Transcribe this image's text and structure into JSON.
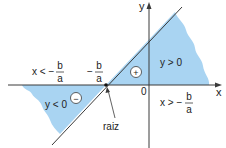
{
  "diagram": {
    "colors": {
      "shade": "#a9d4f2",
      "line": "#3a3a3a",
      "axis": "#3a3a3a",
      "text": "#222222"
    },
    "axes": {
      "x_label": "x",
      "y_label": "y",
      "origin_label": "0"
    },
    "regions": {
      "positive": {
        "label": "y > 0",
        "sign": "+"
      },
      "negative": {
        "label": "y < 0",
        "sign": "−"
      }
    },
    "intervals": {
      "left": {
        "prefix": "x < −",
        "num": "b",
        "den": "a"
      },
      "right": {
        "prefix": "x > −",
        "num": "b",
        "den": "a"
      }
    },
    "root": {
      "value_prefix": "−",
      "num": "b",
      "den": "a",
      "pointer_label": "raiz"
    }
  }
}
